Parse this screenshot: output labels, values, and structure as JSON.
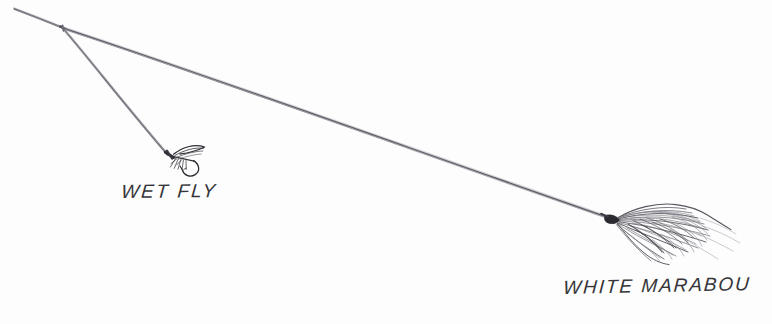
{
  "illustration": {
    "title": "Fly fishing dropper rig — wet fly and white marabou",
    "background_color": "#fdfdfd",
    "line_color": "#70707a",
    "ink_color": "#2b2b30",
    "medium": "pen-and-ink line drawing"
  },
  "labels": {
    "wet_fly": "WET FLY",
    "white_marabou": "WHITE MARABOU"
  },
  "elements": {
    "tippet_line": {
      "name": "tippet-line",
      "from": [
        14,
        9
      ],
      "to": [
        63,
        28
      ],
      "color": "#7a7a84",
      "width": 2.1
    },
    "dropper_line": {
      "name": "dropper-line",
      "from": [
        63,
        28
      ],
      "to": [
        168,
        155
      ],
      "color": "#6e6e78",
      "width": 2.0
    },
    "main_leader_line": {
      "name": "main-leader-line",
      "from": [
        63,
        28
      ],
      "to": [
        612,
        219
      ],
      "color": "#73737d",
      "width": 2.4
    },
    "wet_fly": {
      "name": "wet-fly",
      "head": [
        170,
        155
      ],
      "hook_bend": [
        193,
        174
      ],
      "wing_tip": [
        205,
        148
      ],
      "color": "#303036"
    },
    "white_marabou": {
      "name": "white-marabou-streamer",
      "head": [
        613,
        219
      ],
      "plume_extent": [
        745,
        265
      ],
      "strand_count": 34,
      "color": "#404046"
    }
  }
}
